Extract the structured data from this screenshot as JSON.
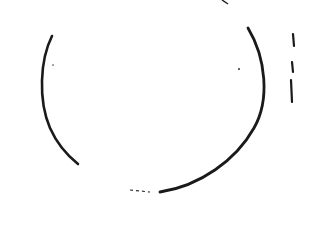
{
  "image": {
    "description": "Scanned hand-drawn circle with gaps, on white background",
    "background": "#ffffff",
    "ink": "#1a1a1a"
  }
}
